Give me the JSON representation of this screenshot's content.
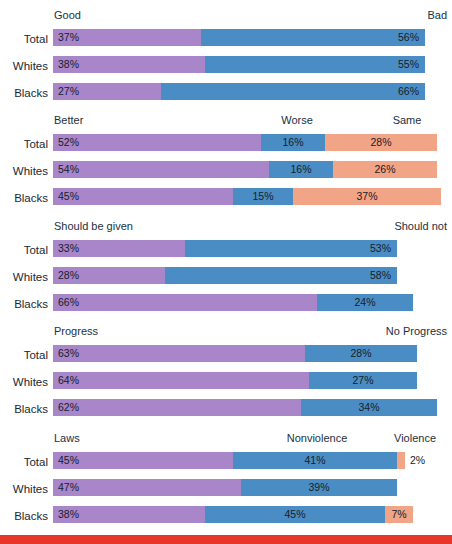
{
  "chart_data": {
    "type": "bar",
    "subtype": "stacked-horizontal-100",
    "title": "",
    "xlabel": "",
    "ylabel": "",
    "xlim": [
      0,
      100
    ],
    "grid": false,
    "legend": "none",
    "note": "Five stacked horizontal bar groups; each group compares Total, Whites and Blacks. Segment labels are printed inside the segments.",
    "row_categories": [
      "Total",
      "Whites",
      "Blacks"
    ],
    "colors": {
      "purple": "#a886c9",
      "blue": "#4a8dc4",
      "salmon": "#f2a486",
      "text": "#1c2733",
      "rule": "#e8362a",
      "background": "#ffffff"
    },
    "groups": [
      {
        "id": "group-race-relations",
        "headers": [
          {
            "label": "Good",
            "align": "start"
          },
          {
            "label": "Bad",
            "align": "end"
          }
        ],
        "series": [
          "Good",
          "Bad"
        ],
        "rows": [
          {
            "label": "Total",
            "segments": [
              {
                "series": "Good",
                "color": "purple",
                "value": 37,
                "value_label": "37%",
                "align": "left"
              },
              {
                "series": "Bad",
                "color": "blue",
                "value": 56,
                "value_label": "56%",
                "align": "right"
              }
            ]
          },
          {
            "label": "Whites",
            "segments": [
              {
                "series": "Good",
                "color": "purple",
                "value": 38,
                "value_label": "38%",
                "align": "left"
              },
              {
                "series": "Bad",
                "color": "blue",
                "value": 55,
                "value_label": "55%",
                "align": "right"
              }
            ]
          },
          {
            "label": "Blacks",
            "segments": [
              {
                "series": "Good",
                "color": "purple",
                "value": 27,
                "value_label": "27%",
                "align": "left"
              },
              {
                "series": "Bad",
                "color": "blue",
                "value": 66,
                "value_label": "66%",
                "align": "right"
              }
            ]
          }
        ]
      },
      {
        "id": "group-better-worse-same",
        "headers": [
          {
            "label": "Better",
            "align": "start"
          },
          {
            "label": "Worse",
            "align": "mid",
            "at": 297
          },
          {
            "label": "Same",
            "align": "mid",
            "at": 407
          }
        ],
        "series": [
          "Better",
          "Worse",
          "Same"
        ],
        "rows": [
          {
            "label": "Total",
            "segments": [
              {
                "series": "Better",
                "color": "purple",
                "value": 52,
                "value_label": "52%",
                "align": "left"
              },
              {
                "series": "Worse",
                "color": "blue",
                "value": 16,
                "value_label": "16%",
                "align": "center"
              },
              {
                "series": "Same",
                "color": "salmon",
                "value": 28,
                "value_label": "28%",
                "align": "center"
              }
            ]
          },
          {
            "label": "Whites",
            "segments": [
              {
                "series": "Better",
                "color": "purple",
                "value": 54,
                "value_label": "54%",
                "align": "left"
              },
              {
                "series": "Worse",
                "color": "blue",
                "value": 16,
                "value_label": "16%",
                "align": "center"
              },
              {
                "series": "Same",
                "color": "salmon",
                "value": 26,
                "value_label": "26%",
                "align": "center"
              }
            ]
          },
          {
            "label": "Blacks",
            "segments": [
              {
                "series": "Better",
                "color": "purple",
                "value": 45,
                "value_label": "45%",
                "align": "left"
              },
              {
                "series": "Worse",
                "color": "blue",
                "value": 15,
                "value_label": "15%",
                "align": "center"
              },
              {
                "series": "Same",
                "color": "salmon",
                "value": 37,
                "value_label": "37%",
                "align": "center"
              }
            ]
          }
        ]
      },
      {
        "id": "group-should-be-given",
        "headers": [
          {
            "label": "Should be given",
            "align": "start"
          },
          {
            "label": "Should not",
            "align": "end"
          }
        ],
        "series": [
          "Should be given",
          "Should not"
        ],
        "rows": [
          {
            "label": "Total",
            "segments": [
              {
                "series": "Should be given",
                "color": "purple",
                "value": 33,
                "value_label": "33%",
                "align": "left"
              },
              {
                "series": "Should not",
                "color": "blue",
                "value": 53,
                "value_label": "53%",
                "align": "right"
              }
            ]
          },
          {
            "label": "Whites",
            "segments": [
              {
                "series": "Should be given",
                "color": "purple",
                "value": 28,
                "value_label": "28%",
                "align": "left"
              },
              {
                "series": "Should not",
                "color": "blue",
                "value": 58,
                "value_label": "58%",
                "align": "right"
              }
            ]
          },
          {
            "label": "Blacks",
            "segments": [
              {
                "series": "Should be given",
                "color": "purple",
                "value": 66,
                "value_label": "66%",
                "align": "left"
              },
              {
                "series": "Should not",
                "color": "blue",
                "value": 24,
                "value_label": "24%",
                "align": "center"
              }
            ]
          }
        ]
      },
      {
        "id": "group-progress",
        "headers": [
          {
            "label": "Progress",
            "align": "start"
          },
          {
            "label": "No Progress",
            "align": "end"
          }
        ],
        "series": [
          "Progress",
          "No Progress"
        ],
        "rows": [
          {
            "label": "Total",
            "segments": [
              {
                "series": "Progress",
                "color": "purple",
                "value": 63,
                "value_label": "63%",
                "align": "left"
              },
              {
                "series": "No Progress",
                "color": "blue",
                "value": 28,
                "value_label": "28%",
                "align": "center"
              }
            ]
          },
          {
            "label": "Whites",
            "segments": [
              {
                "series": "Progress",
                "color": "purple",
                "value": 64,
                "value_label": "64%",
                "align": "left"
              },
              {
                "series": "No Progress",
                "color": "blue",
                "value": 27,
                "value_label": "27%",
                "align": "center"
              }
            ]
          },
          {
            "label": "Blacks",
            "segments": [
              {
                "series": "Progress",
                "color": "purple",
                "value": 62,
                "value_label": "62%",
                "align": "left"
              },
              {
                "series": "No Progress",
                "color": "blue",
                "value": 34,
                "value_label": "34%",
                "align": "center"
              }
            ]
          }
        ]
      },
      {
        "id": "group-laws-nonviolence-violence",
        "headers": [
          {
            "label": "Laws",
            "align": "start"
          },
          {
            "label": "Nonviolence",
            "align": "mid",
            "at": 317
          },
          {
            "label": "Violence",
            "align": "mid",
            "at": 415
          }
        ],
        "series": [
          "Laws",
          "Nonviolence",
          "Violence"
        ],
        "rows": [
          {
            "label": "Total",
            "segments": [
              {
                "series": "Laws",
                "color": "purple",
                "value": 45,
                "value_label": "45%",
                "align": "left"
              },
              {
                "series": "Nonviolence",
                "color": "blue",
                "value": 41,
                "value_label": "41%",
                "align": "center"
              },
              {
                "series": "Violence",
                "color": "salmon",
                "value": 2,
                "value_label": "2%",
                "align": "outside"
              }
            ]
          },
          {
            "label": "Whites",
            "segments": [
              {
                "series": "Laws",
                "color": "purple",
                "value": 47,
                "value_label": "47%",
                "align": "left"
              },
              {
                "series": "Nonviolence",
                "color": "blue",
                "value": 39,
                "value_label": "39%",
                "align": "center"
              }
            ]
          },
          {
            "label": "Blacks",
            "segments": [
              {
                "series": "Laws",
                "color": "purple",
                "value": 38,
                "value_label": "38%",
                "align": "left"
              },
              {
                "series": "Nonviolence",
                "color": "blue",
                "value": 45,
                "value_label": "45%",
                "align": "center"
              },
              {
                "series": "Violence",
                "color": "salmon",
                "value": 7,
                "value_label": "7%",
                "align": "center"
              }
            ]
          }
        ]
      }
    ]
  }
}
